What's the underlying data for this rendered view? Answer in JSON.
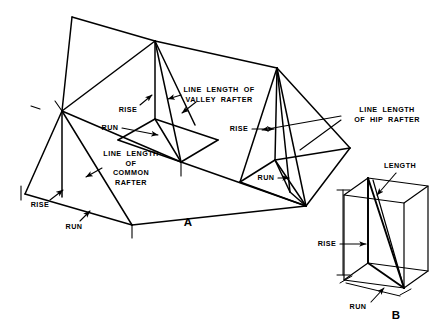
{
  "figure": {
    "kind": "roof-framing-diagram",
    "background_color": "#ffffff",
    "ink_color": "#000000",
    "width": 442,
    "height": 331
  },
  "panels": [
    {
      "id": "A",
      "letter": "A",
      "description": "Roof framing showing common, valley and hip rafters",
      "x": 188,
      "y": 222
    },
    {
      "id": "B",
      "letter": "B",
      "description": "Rafter length, rise and run in a rectangular box",
      "x": 396,
      "y": 315
    }
  ],
  "labels": {
    "common_rafter": "LINE  LENGTH\nOF\nCOMMON\nRAFTER",
    "valley_rafter": "LINE  LENGTH  OF\nVALLEY  RAFTER",
    "hip_rafter": "LINE  LENGTH\nOF  HIP  RAFTER",
    "length": "LENGTH",
    "rise": "RISE",
    "run": "RUN"
  },
  "annotations": [
    {
      "name": "common-rafter-label",
      "text_key": "common_rafter",
      "x": 131,
      "y": 168,
      "lines": 4
    },
    {
      "name": "valley-rafter-label",
      "text_key": "valley_rafter",
      "x": 219,
      "y": 95,
      "lines": 2
    },
    {
      "name": "hip-rafter-label",
      "text_key": "hip_rafter",
      "x": 387,
      "y": 115,
      "lines": 2
    },
    {
      "name": "length-label-b",
      "text_key": "length",
      "x": 400,
      "y": 166,
      "lines": 1
    },
    {
      "name": "rise-label-common",
      "text_key": "rise",
      "x": 40,
      "y": 205,
      "lines": 1
    },
    {
      "name": "run-label-common",
      "text_key": "run",
      "x": 74,
      "y": 227,
      "lines": 1
    },
    {
      "name": "rise-label-valley",
      "text_key": "rise",
      "x": 128,
      "y": 110,
      "lines": 1
    },
    {
      "name": "run-label-valley",
      "text_key": "run",
      "x": 110,
      "y": 128,
      "lines": 1
    },
    {
      "name": "rise-label-hip",
      "text_key": "rise",
      "x": 239,
      "y": 129,
      "lines": 1
    },
    {
      "name": "run-label-hip",
      "text_key": "run",
      "x": 266,
      "y": 178,
      "lines": 1
    },
    {
      "name": "rise-label-b",
      "text_key": "rise",
      "x": 327,
      "y": 244,
      "lines": 1
    },
    {
      "name": "run-label-b",
      "text_key": "run",
      "x": 358,
      "y": 307,
      "lines": 1
    }
  ]
}
